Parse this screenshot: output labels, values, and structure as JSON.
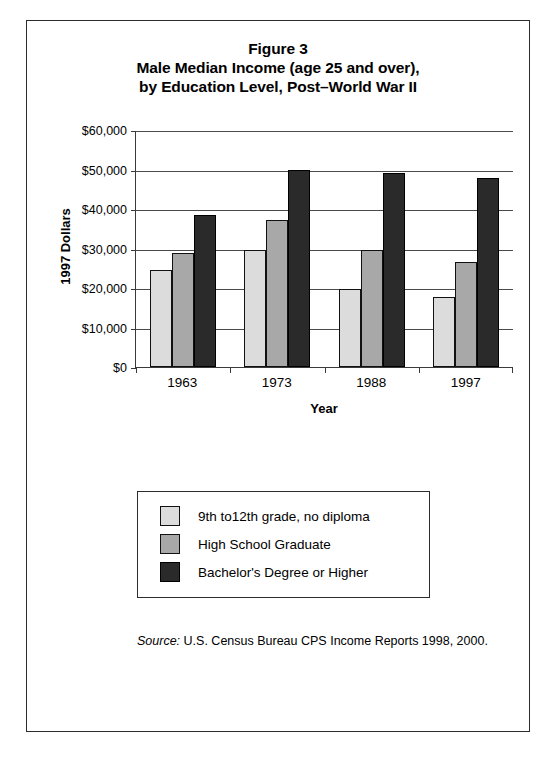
{
  "figure": {
    "title_lines": [
      "Figure 3",
      "Male Median Income (age 25 and over),",
      "by Education Level, Post–World War II"
    ],
    "source_label": "Source:",
    "source_text": " U.S. Census Bureau CPS Income Reports 1998, 2000."
  },
  "colors": {
    "series_light": "#dcdcdc",
    "series_medium": "#a8a8a8",
    "series_dark": "#2a2a2a",
    "axis": "#3a3a3a",
    "frame": "#2c2c2c",
    "background": "#ffffff"
  },
  "chart_data": {
    "type": "bar",
    "xlabel": "Year",
    "ylabel": "1997 Dollars",
    "categories": [
      "1963",
      "1973",
      "1988",
      "1997"
    ],
    "series": [
      {
        "name": "9th to12th grade, no diploma",
        "color": "#dcdcdc",
        "values": [
          24500,
          29600,
          19800,
          17800
        ]
      },
      {
        "name": "High School Graduate",
        "color": "#a8a8a8",
        "values": [
          28900,
          37200,
          29500,
          26500
        ]
      },
      {
        "name": "Bachelor's Degree or Higher",
        "color": "#2a2a2a",
        "values": [
          38600,
          50000,
          49000,
          47800
        ]
      }
    ],
    "ylim": [
      0,
      60000
    ],
    "ytick_values": [
      0,
      10000,
      20000,
      30000,
      40000,
      50000,
      60000
    ],
    "ytick_labels": [
      "$0",
      "$10,000",
      "$20,000",
      "$30,000",
      "$40,000",
      "$50,000",
      "$60,000"
    ],
    "grid": true,
    "legend_position": "below-plot"
  }
}
